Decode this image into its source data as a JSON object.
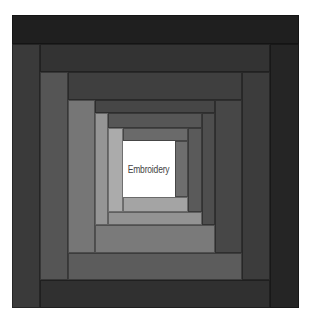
{
  "figure": {
    "center_label": "Embroidery",
    "center_color": "#ffffff",
    "strips": [
      {
        "name": "ring1-top",
        "x": 12,
        "y": 15,
        "w": 287,
        "h": 29,
        "color": "#1f1f1f"
      },
      {
        "name": "ring1-right",
        "x": 270,
        "y": 44,
        "w": 29,
        "h": 264,
        "color": "#252525"
      },
      {
        "name": "ring1-left",
        "x": 12,
        "y": 44,
        "w": 28,
        "h": 264,
        "color": "#3a3a3a"
      },
      {
        "name": "ring1-bottom",
        "x": 40,
        "y": 280,
        "w": 230,
        "h": 28,
        "color": "#303030"
      },
      {
        "name": "ring2-top",
        "x": 40,
        "y": 44,
        "w": 230,
        "h": 28,
        "color": "#333333"
      },
      {
        "name": "ring2-right",
        "x": 242,
        "y": 72,
        "w": 28,
        "h": 208,
        "color": "#3c3c3c"
      },
      {
        "name": "ring2-left",
        "x": 40,
        "y": 72,
        "w": 28,
        "h": 208,
        "color": "#555555"
      },
      {
        "name": "ring2-bottom",
        "x": 68,
        "y": 253,
        "w": 174,
        "h": 27,
        "color": "#5c5c5c"
      },
      {
        "name": "ring3-top",
        "x": 68,
        "y": 72,
        "w": 174,
        "h": 28,
        "color": "#3f3f3f"
      },
      {
        "name": "ring3-right",
        "x": 215,
        "y": 100,
        "w": 27,
        "h": 153,
        "color": "#474747"
      },
      {
        "name": "ring3-left",
        "x": 68,
        "y": 100,
        "w": 27,
        "h": 153,
        "color": "#767676"
      },
      {
        "name": "ring3-bottom",
        "x": 95,
        "y": 225,
        "w": 120,
        "h": 28,
        "color": "#7a7a7a"
      },
      {
        "name": "ring4-top",
        "x": 95,
        "y": 100,
        "w": 120,
        "h": 13,
        "color": "#464646"
      },
      {
        "name": "ring4-right",
        "x": 202,
        "y": 113,
        "w": 13,
        "h": 112,
        "color": "#4e4e4e"
      },
      {
        "name": "ring4-left",
        "x": 95,
        "y": 113,
        "w": 13,
        "h": 112,
        "color": "#959595"
      },
      {
        "name": "ring4-bottom",
        "x": 108,
        "y": 212,
        "w": 94,
        "h": 13,
        "color": "#939393"
      },
      {
        "name": "ring5-top",
        "x": 108,
        "y": 113,
        "w": 94,
        "h": 15,
        "color": "#565656"
      },
      {
        "name": "ring5-right",
        "x": 188,
        "y": 128,
        "w": 14,
        "h": 84,
        "color": "#5a5a5a"
      },
      {
        "name": "ring5-left",
        "x": 108,
        "y": 128,
        "w": 15,
        "h": 84,
        "color": "#ababab"
      },
      {
        "name": "ring5-bottom",
        "x": 123,
        "y": 197,
        "w": 65,
        "h": 15,
        "color": "#a4a4a4"
      },
      {
        "name": "ring6-top",
        "x": 123,
        "y": 128,
        "w": 65,
        "h": 13,
        "color": "#6a6a6a"
      },
      {
        "name": "ring6-right",
        "x": 175,
        "y": 141,
        "w": 13,
        "h": 56,
        "color": "#6e6e6e"
      }
    ],
    "center": {
      "x": 123,
      "y": 141,
      "w": 52,
      "h": 56
    }
  }
}
